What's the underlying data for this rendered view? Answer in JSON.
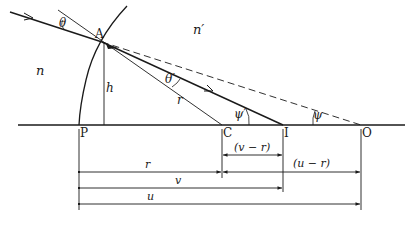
{
  "diagram": {
    "type": "refraction at spherical surface",
    "media": {
      "left": "n",
      "right": "n′"
    },
    "points": {
      "A": "A",
      "P": "P",
      "C": "C",
      "I": "I",
      "O": "O"
    },
    "angles": {
      "incidence": "θ",
      "refraction": "θ′",
      "psi_prime": "ψ′",
      "psi": "ψ"
    },
    "segments": {
      "height": "h",
      "radius": "r"
    },
    "dimensions": {
      "r": "r",
      "v": "v",
      "u": "u",
      "v_minus_r": "(v − r)",
      "u_minus_r": "(u − r)"
    },
    "colors": {
      "ink": "#1a1a1a",
      "background": "#ffffff"
    }
  }
}
